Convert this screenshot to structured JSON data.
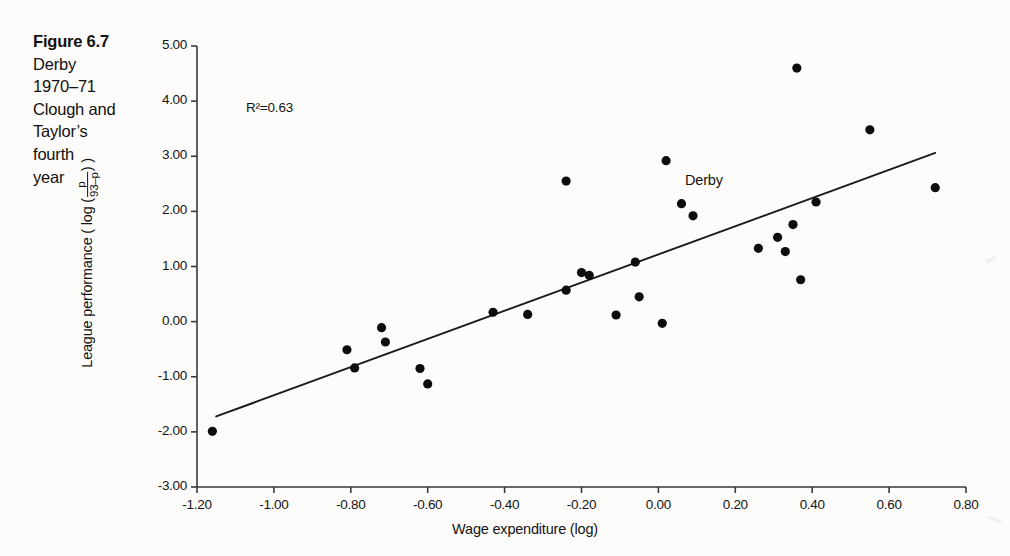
{
  "figure": {
    "caption_lines": [
      "Figure 6.7",
      "Derby",
      "1970–71",
      "Clough and",
      "Taylor’s",
      "fourth",
      "year"
    ]
  },
  "annotations": {
    "r2_text": "R²=0.63",
    "derby_point_label": "Derby"
  },
  "axes": {
    "x_title": "Wage expenditure (log)",
    "y_title_prefix": "League performance ( log (",
    "y_title_numerator": "p",
    "y_title_denominator": "93–p",
    "y_title_suffix": ") )",
    "x_ticks": [
      "-1.20",
      "-1.00",
      "-0.80",
      "-0.60",
      "-0.40",
      "-0.20",
      "0.00",
      "0.20",
      "0.40",
      "0.60",
      "0.80"
    ],
    "y_ticks": [
      "5.00",
      "4.00",
      "3.00",
      "2.00",
      "1.00",
      "0.00",
      "-1.00",
      "-2.00",
      "-3.00"
    ]
  },
  "style": {
    "axis_color": "#3a3a3a",
    "point_color": "#0d0d0d",
    "line_color": "#1a1a1a"
  },
  "chart_data": {
    "type": "scatter",
    "title": "Figure 6.7 Derby 1970–71 Clough and Taylor’s fourth year",
    "xlabel": "Wage expenditure (log)",
    "ylabel": "League performance (log (p/(93-p)))",
    "xlim": [
      -1.2,
      0.8
    ],
    "ylim": [
      -3.0,
      5.0
    ],
    "xticks": [
      -1.2,
      -1.0,
      -0.8,
      -0.6,
      -0.4,
      -0.2,
      0.0,
      0.2,
      0.4,
      0.6,
      0.8
    ],
    "yticks": [
      -3.0,
      -2.0,
      -1.0,
      0.0,
      1.0,
      2.0,
      3.0,
      4.0,
      5.0
    ],
    "grid": false,
    "legend": null,
    "r_squared": 0.63,
    "annotations": [
      {
        "text": "R²=0.63",
        "x": -0.93,
        "y": 3.72
      },
      {
        "text": "Derby",
        "x": 0.07,
        "y": 2.33,
        "points_to": [
          0.06,
          2.14
        ]
      }
    ],
    "points": [
      {
        "x": -1.16,
        "y": -1.99
      },
      {
        "x": -0.81,
        "y": -0.51
      },
      {
        "x": -0.79,
        "y": -0.84
      },
      {
        "x": -0.72,
        "y": -0.11
      },
      {
        "x": -0.71,
        "y": -0.37
      },
      {
        "x": -0.62,
        "y": -0.85
      },
      {
        "x": -0.6,
        "y": -1.13
      },
      {
        "x": -0.43,
        "y": 0.17
      },
      {
        "x": -0.34,
        "y": 0.13
      },
      {
        "x": -0.24,
        "y": 2.55
      },
      {
        "x": -0.24,
        "y": 0.57
      },
      {
        "x": -0.2,
        "y": 0.89
      },
      {
        "x": -0.18,
        "y": 0.84
      },
      {
        "x": -0.11,
        "y": 0.12
      },
      {
        "x": -0.06,
        "y": 1.08
      },
      {
        "x": -0.05,
        "y": 0.45
      },
      {
        "x": 0.01,
        "y": -0.03
      },
      {
        "x": 0.02,
        "y": 2.92
      },
      {
        "x": 0.06,
        "y": 2.14
      },
      {
        "x": 0.09,
        "y": 1.92
      },
      {
        "x": 0.26,
        "y": 1.33
      },
      {
        "x": 0.31,
        "y": 1.53
      },
      {
        "x": 0.33,
        "y": 1.27
      },
      {
        "x": 0.35,
        "y": 1.76
      },
      {
        "x": 0.36,
        "y": 4.6
      },
      {
        "x": 0.37,
        "y": 0.76
      },
      {
        "x": 0.41,
        "y": 2.17
      },
      {
        "x": 0.55,
        "y": 3.48
      },
      {
        "x": 0.72,
        "y": 2.43
      }
    ],
    "trendline": {
      "x0": -1.15,
      "y0": -1.72,
      "x1": 0.72,
      "y1": 3.06
    }
  }
}
